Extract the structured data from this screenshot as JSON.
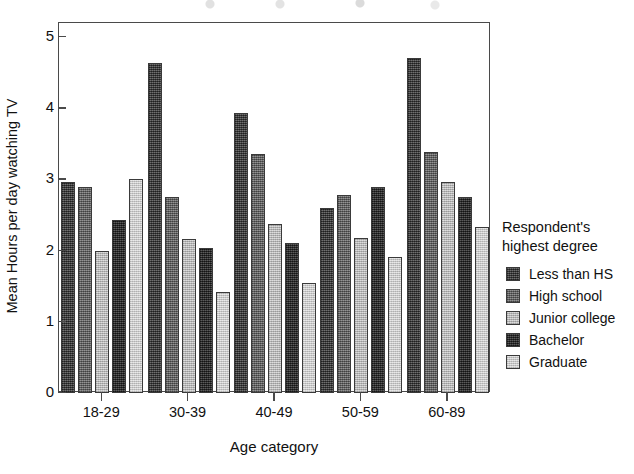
{
  "chart_data": {
    "type": "bar",
    "title": "",
    "xlabel": "Age category",
    "ylabel": "Mean Hours per day watching TV",
    "categories": [
      "18-29",
      "30-39",
      "40-49",
      "50-59",
      "60-89"
    ],
    "ylim": [
      0,
      5.2
    ],
    "yticks": [
      "0",
      "1",
      "2",
      "3",
      "4",
      "5"
    ],
    "ytick_values": [
      0,
      1,
      2,
      3,
      4,
      5
    ],
    "grid": false,
    "legend_position": "right",
    "legend_title": "Respondent's\nhighest degree",
    "series": [
      {
        "name": "Less than HS",
        "color": "#4a4a4a",
        "values": [
          2.97,
          4.64,
          3.93,
          2.6,
          4.71
        ]
      },
      {
        "name": "High school",
        "color": "#6e6e6e",
        "values": [
          2.89,
          2.75,
          3.35,
          2.78,
          3.39
        ]
      },
      {
        "name": "Junior college",
        "color": "#c2c2c2",
        "values": [
          2.0,
          2.16,
          2.37,
          2.17,
          2.97
        ]
      },
      {
        "name": "Bachelor",
        "color": "#3b3b3b",
        "values": [
          2.43,
          2.04,
          2.1,
          2.89,
          2.75
        ]
      },
      {
        "name": "Graduate",
        "color": "#cfcfcf",
        "values": [
          3.0,
          1.42,
          1.54,
          1.91,
          2.33
        ]
      }
    ]
  },
  "legend": {
    "title_line1": "Respondent's",
    "title_line2": "highest degree"
  },
  "axes": {
    "x_title": "Age category",
    "y_title": "Mean Hours per day watching TV"
  }
}
